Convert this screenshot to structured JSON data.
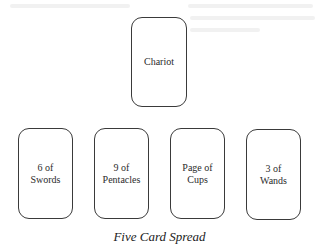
{
  "diagram": {
    "title": "Five Card Spread",
    "top_card": {
      "label": "Chariot"
    },
    "bottom_cards": [
      {
        "label": "6 of\nSwords"
      },
      {
        "label": "9 of\nPentacles"
      },
      {
        "label": "Page of\nCups"
      },
      {
        "label": "3 of\nWands"
      }
    ]
  }
}
